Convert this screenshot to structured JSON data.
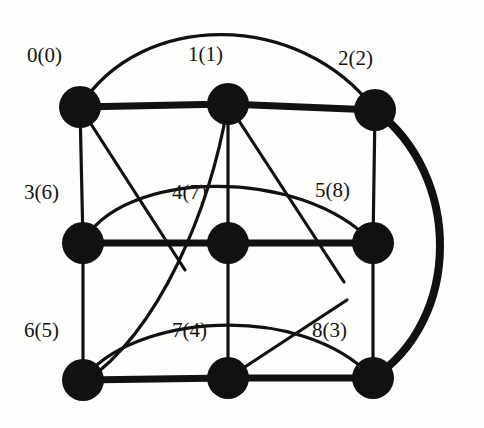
{
  "figure": {
    "kind": "undirected-graph-drawing",
    "title": "",
    "background_color": "#fdfdfb",
    "ink_color": "#111111",
    "node_fill": "#111111",
    "node_radius": 21,
    "canvas": {
      "width": 484,
      "height": 428
    }
  },
  "nodes": [
    {
      "id": "n0",
      "label": "0(0)",
      "name": "0",
      "alias": "0",
      "x": 80,
      "y": 107,
      "label_x": 27,
      "label_y": 45
    },
    {
      "id": "n1",
      "label": "1(1)",
      "name": "1",
      "alias": "1",
      "x": 228,
      "y": 104,
      "label_x": 188,
      "label_y": 44
    },
    {
      "id": "n2",
      "label": "2(2)",
      "name": "2",
      "alias": "2",
      "x": 375,
      "y": 110,
      "label_x": 338,
      "label_y": 48
    },
    {
      "id": "n3",
      "label": "3(6)",
      "name": "3",
      "alias": "6",
      "x": 83,
      "y": 243,
      "label_x": 24,
      "label_y": 182
    },
    {
      "id": "n4",
      "label": "4(7)",
      "name": "4",
      "alias": "7",
      "x": 228,
      "y": 243,
      "label_x": 172,
      "label_y": 182
    },
    {
      "id": "n5",
      "label": "5(8)",
      "name": "5",
      "alias": "8",
      "x": 373,
      "y": 243,
      "label_x": 315,
      "label_y": 180
    },
    {
      "id": "n6",
      "label": "6(5)",
      "name": "6",
      "alias": "5",
      "x": 83,
      "y": 380,
      "label_x": 24,
      "label_y": 320
    },
    {
      "id": "n7",
      "label": "7(4)",
      "name": "7",
      "alias": "4",
      "x": 228,
      "y": 378,
      "label_x": 172,
      "label_y": 320
    },
    {
      "id": "n8",
      "label": "8(3)",
      "name": "8",
      "alias": "3",
      "x": 373,
      "y": 378,
      "label_x": 312,
      "label_y": 320
    }
  ],
  "edges": [
    {
      "id": "e-0-1",
      "from": "0",
      "to": "1",
      "shape": "straight",
      "weight": "thick",
      "d": "M 80 107 L 228 104"
    },
    {
      "id": "e-1-2",
      "from": "1",
      "to": "2",
      "shape": "straight",
      "weight": "thick",
      "d": "M 228 104 L 375 110"
    },
    {
      "id": "e-3-4",
      "from": "3",
      "to": "4",
      "shape": "straight",
      "weight": "thick",
      "d": "M 83 243 L 228 243"
    },
    {
      "id": "e-4-5",
      "from": "4",
      "to": "5",
      "shape": "straight",
      "weight": "thick",
      "d": "M 228 243 L 373 243"
    },
    {
      "id": "e-6-7",
      "from": "6",
      "to": "7",
      "shape": "straight",
      "weight": "thick",
      "d": "M 83 380 L 228 378"
    },
    {
      "id": "e-7-8",
      "from": "7",
      "to": "8",
      "shape": "straight",
      "weight": "thick",
      "d": "M 228 378 L 373 378"
    },
    {
      "id": "e-0-3",
      "from": "0",
      "to": "3",
      "shape": "straight",
      "weight": "thin",
      "d": "M 80 107 L 83 243"
    },
    {
      "id": "e-3-6",
      "from": "3",
      "to": "6",
      "shape": "straight",
      "weight": "thin",
      "d": "M 83 243 L 83 380"
    },
    {
      "id": "e-1-4",
      "from": "1",
      "to": "4",
      "shape": "straight",
      "weight": "thin",
      "d": "M 228 104 L 228 243"
    },
    {
      "id": "e-4-7",
      "from": "4",
      "to": "7",
      "shape": "straight",
      "weight": "thin",
      "d": "M 228 243 L 228 378"
    },
    {
      "id": "e-2-5",
      "from": "2",
      "to": "5",
      "shape": "straight",
      "weight": "thin",
      "d": "M 375 110 L 373 243"
    },
    {
      "id": "e-5-8",
      "from": "5",
      "to": "8",
      "shape": "straight",
      "weight": "thin",
      "d": "M 373 243 L 373 378"
    },
    {
      "id": "e-0-4d",
      "from": "0",
      "to": "4",
      "shape": "diagonal",
      "weight": "thin",
      "d": "M 80 107 L 185 270"
    },
    {
      "id": "e-1-5d",
      "from": "1",
      "to": "5",
      "shape": "diagonal",
      "weight": "thin",
      "d": "M 228 104 L 344 282"
    },
    {
      "id": "e-7-8d",
      "from": "7",
      "to": "8",
      "shape": "diagonal",
      "weight": "thin",
      "d": "M 228 378 L 347 300"
    },
    {
      "id": "e-0-2-arc",
      "from": "0",
      "to": "2",
      "shape": "arc-top",
      "weight": "thin",
      "d": "M 80 107 C 140 10 300 10 375 110"
    },
    {
      "id": "e-2-8-arc",
      "from": "2",
      "to": "8",
      "shape": "arc-right",
      "weight": "thick",
      "d": "M 375 110 C 462 175 462 320 373 378"
    },
    {
      "id": "e-3-5-arc",
      "from": "3",
      "to": "5",
      "shape": "arc-interior",
      "weight": "thin",
      "d": "M 83 243 C 120 170 300 165 373 243"
    },
    {
      "id": "e-6-8-arc",
      "from": "6",
      "to": "8",
      "shape": "arc-interior",
      "weight": "thin",
      "d": "M 83 380 C 130 315 300 300 373 378"
    },
    {
      "id": "e-1-6-curve",
      "from": "1",
      "to": "6",
      "shape": "curve",
      "weight": "thin",
      "d": "M 228 104 C 210 210 160 330 85 382"
    }
  ],
  "legend": {
    "note": ""
  }
}
